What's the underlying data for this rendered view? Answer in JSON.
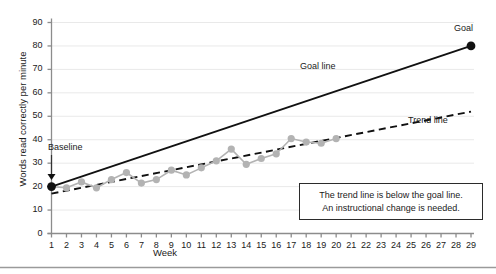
{
  "chart_data": {
    "type": "line",
    "title": "",
    "xlabel": "Week",
    "ylabel": "Words read correctly per minute",
    "xlim": [
      1,
      29
    ],
    "ylim": [
      0,
      90
    ],
    "yticks": [
      0,
      10,
      20,
      30,
      40,
      50,
      60,
      70,
      80,
      90
    ],
    "xticks": [
      1,
      2,
      3,
      4,
      5,
      6,
      7,
      8,
      9,
      10,
      11,
      12,
      13,
      14,
      15,
      16,
      17,
      18,
      19,
      20,
      21,
      22,
      23,
      24,
      25,
      26,
      27,
      28,
      29
    ],
    "grid": true,
    "legend_position": "inline-annotations",
    "series": [
      {
        "name": "Student scores",
        "style": "markers-and-line",
        "color": "#b3b3b3",
        "x": [
          1,
          2,
          3,
          4,
          5,
          6,
          7,
          8,
          9,
          10,
          11,
          12,
          13,
          14,
          15,
          16,
          17,
          18,
          19,
          20
        ],
        "values": [
          20,
          19.5,
          22,
          19.5,
          23,
          26,
          21.5,
          23,
          27,
          25,
          28,
          31,
          36,
          29.5,
          32,
          34,
          40.5,
          39,
          38.5,
          40.5
        ]
      },
      {
        "name": "Goal line",
        "style": "solid",
        "color": "#111111",
        "x": [
          1,
          29
        ],
        "values": [
          20,
          80
        ]
      },
      {
        "name": "Trend line",
        "style": "dashed",
        "color": "#111111",
        "x": [
          1,
          29
        ],
        "values": [
          17,
          52
        ]
      }
    ],
    "points": [
      {
        "name": "baseline-point",
        "x": 1,
        "y": 20,
        "color": "#111111"
      },
      {
        "name": "goal-point",
        "x": 29,
        "y": 80,
        "color": "#111111"
      }
    ],
    "annotations": {
      "baseline": "Baseline",
      "goal": "Goal",
      "goal_line": "Goal line",
      "trend_line": "Trend line",
      "callout_line1": "The trend line is below the goal line.",
      "callout_line2": "An instructional change is needed."
    }
  },
  "colors": {
    "marker": "#b3b3b3",
    "line_dark": "#111111",
    "grid": "#e9e9e9",
    "axis": "#8c8c8c",
    "border": "#2b2b2b"
  }
}
